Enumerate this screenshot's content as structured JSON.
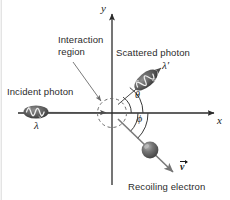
{
  "figure": {
    "background_color": "#ffffff",
    "line_color": "#3a3a3a",
    "text_color": "#2b2b2b"
  },
  "axes": {
    "x_label": "x",
    "y_label": "y",
    "origin_label": "",
    "x_axis_name": "x-axis",
    "y_axis_name": "y-axis"
  },
  "labels": {
    "interaction_region_line1": "Interaction",
    "interaction_region_line2": "region",
    "incident_photon": "Incident photon",
    "scattered_photon": "Scattered photon",
    "recoiling_electron": "Recoiling electron"
  },
  "symbols": {
    "incident_wavelength": "λ",
    "scattered_wavelength": "λ′",
    "scatter_angle": "θ",
    "recoil_angle": "ϕ",
    "velocity_vector": "v"
  },
  "elements": {
    "interaction_circle_name": "interaction-region-circle",
    "incident_photon_wave_name": "incident-photon-wave-packet",
    "scattered_photon_wave_name": "scattered-photon-wave-packet",
    "electron_name": "recoiling-electron-sphere",
    "velocity_arrow_name": "electron-velocity-arrow",
    "theta_arc_name": "theta-angle-arc",
    "phi_arc_name": "phi-angle-arc",
    "leader_line_name": "interaction-region-leader-line"
  },
  "geometry": {
    "origin_x": 112,
    "origin_y": 113,
    "interaction_radius": 14,
    "scatter_angle_deg": 55,
    "recoil_angle_deg": 45
  },
  "colors": {
    "photon_dark": "#4d4d4d",
    "electron_fill": "#595959",
    "electron_highlight": "#a8a8a8",
    "axis": "#3a3a3a"
  }
}
